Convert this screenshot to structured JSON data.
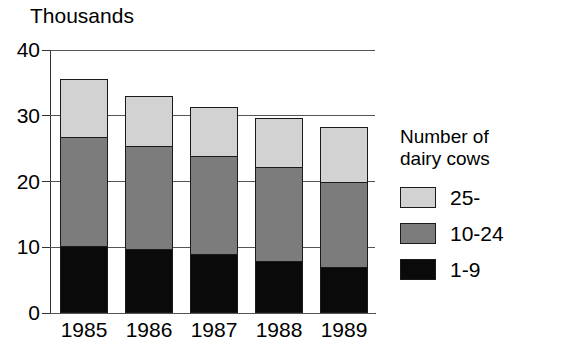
{
  "chart_data": {
    "type": "bar",
    "subtype": "stacked-bar",
    "title": "",
    "ylabel": "Thousands",
    "xlabel": "",
    "categories": [
      "1985",
      "1986",
      "1987",
      "1988",
      "1989"
    ],
    "ylim": [
      0,
      40
    ],
    "yticks": [
      "0",
      "10",
      "20",
      "30",
      "40"
    ],
    "ytick_values": [
      0,
      10,
      20,
      30,
      40
    ],
    "grid": true,
    "legend_position": "right",
    "legend_title_lines": [
      "Number of",
      "dairy cows"
    ],
    "series": [
      {
        "name": "1-9",
        "values": [
          10.0,
          9.6,
          8.8,
          7.8,
          6.8
        ],
        "color": "#0a0a0a"
      },
      {
        "name": "10-24",
        "values": [
          16.6,
          15.7,
          14.9,
          14.3,
          12.9
        ],
        "color": "#7c7c7c"
      },
      {
        "name": "25-",
        "values": [
          8.8,
          7.6,
          7.5,
          7.4,
          8.4
        ],
        "color": "#d2d2d2"
      }
    ],
    "totals": [
      35.4,
      32.9,
      31.2,
      29.5,
      28.1
    ]
  },
  "legend": {
    "title_line1": "Number of",
    "title_line2": "dairy cows",
    "items": [
      {
        "label": "25-"
      },
      {
        "label": "10-24"
      },
      {
        "label": "1-9"
      }
    ]
  }
}
